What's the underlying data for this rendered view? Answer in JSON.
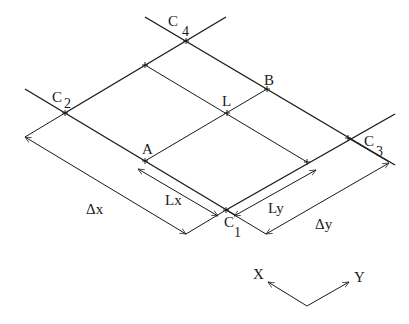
{
  "diagram": {
    "corners": {
      "c1": {
        "letter": "C",
        "sub": "1"
      },
      "c2": {
        "letter": "C",
        "sub": "2"
      },
      "c3": {
        "letter": "C",
        "sub": "3"
      },
      "c4": {
        "letter": "C",
        "sub": "4"
      }
    },
    "points": {
      "a": "A",
      "b": "B",
      "l": "L"
    },
    "dimensions": {
      "delta_x": "Δx",
      "delta_y": "Δy",
      "lx": "Lx",
      "ly": "Ly"
    },
    "axes": {
      "x": "X",
      "y": "Y"
    },
    "colors": {
      "line": "#1a1a1a",
      "background": "#ffffff"
    }
  }
}
